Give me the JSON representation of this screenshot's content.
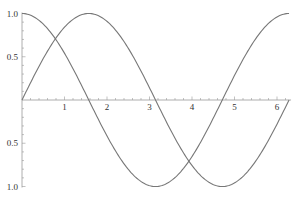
{
  "chart_data": {
    "type": "line",
    "title": "",
    "xlabel": "",
    "ylabel": "",
    "xlim": [
      0,
      6.2832
    ],
    "ylim": [
      -1.0,
      1.0
    ],
    "grid": false,
    "legend": null,
    "x_ticks": [
      {
        "value": 1,
        "label": "1"
      },
      {
        "value": 2,
        "label": "2"
      },
      {
        "value": 3,
        "label": "3"
      },
      {
        "value": 4,
        "label": "4"
      },
      {
        "value": 5,
        "label": "5"
      },
      {
        "value": 6,
        "label": "6"
      }
    ],
    "y_ticks": [
      {
        "value": 1.0,
        "label": "1.0"
      },
      {
        "value": 0.5,
        "label": "0.5"
      },
      {
        "value": -0.5,
        "label": "0.5"
      },
      {
        "value": -1.0,
        "label": "1.0"
      }
    ],
    "series": [
      {
        "name": "sin(x)",
        "color": "#777777",
        "x": [
          0,
          0.5236,
          1.0472,
          1.5708,
          2.0944,
          2.618,
          3.1416,
          3.6652,
          4.1888,
          4.7124,
          5.236,
          5.7596,
          6.2832
        ],
        "values": [
          0,
          0.5,
          0.866,
          1.0,
          0.866,
          0.5,
          0,
          -0.5,
          -0.866,
          -1.0,
          -0.866,
          -0.5,
          0
        ]
      },
      {
        "name": "cos(x)",
        "color": "#777777",
        "x": [
          0,
          0.5236,
          1.0472,
          1.5708,
          2.0944,
          2.618,
          3.1416,
          3.6652,
          4.1888,
          4.7124,
          5.236,
          5.7596,
          6.2832
        ],
        "values": [
          1.0,
          0.866,
          0.5,
          0,
          -0.5,
          -0.866,
          -1.0,
          -0.866,
          -0.5,
          0,
          0.5,
          0.866,
          1.0
        ]
      }
    ]
  },
  "layout": {
    "origin_x_px": 22,
    "origin_y_px": 100,
    "px_per_x_unit": 42.5,
    "px_per_y_unit": 86.5,
    "axis_color": "#999999",
    "curve_color": "#777777",
    "label_color": "#333333"
  }
}
